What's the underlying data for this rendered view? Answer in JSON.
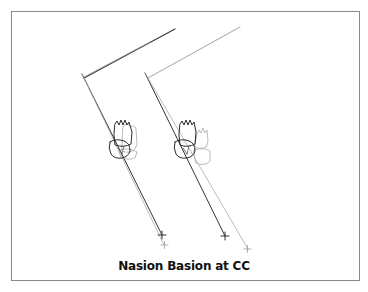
{
  "figure": {
    "caption": "Nasion Basion at CC",
    "colors": {
      "dark_line": "#333333",
      "light_line": "#a0a0a0",
      "border": "#8a8a8a"
    },
    "panels": [
      {
        "name": "left-tracing",
        "description": "superimposed dark and light tracings with molars"
      },
      {
        "name": "right-tracing",
        "description": "superimposed dark and light tracings with displaced molars"
      }
    ]
  }
}
